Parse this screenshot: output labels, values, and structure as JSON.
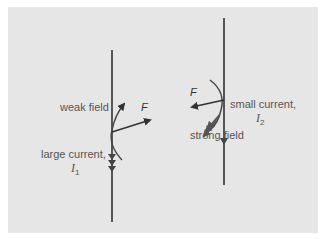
{
  "diagram": {
    "title": "",
    "colors": {
      "background": "#e6e6e6",
      "wire": "#333333",
      "arrow": "#333333",
      "text": "#555555"
    },
    "left_wire": {
      "field_label": "weak field",
      "force_label": "F",
      "current_label": "large current,",
      "current_symbol": "I",
      "current_subscript": "1"
    },
    "right_wire": {
      "field_label": "strong field",
      "force_label": "F",
      "current_label": "small current,",
      "current_symbol": "I",
      "current_subscript": "2"
    }
  }
}
